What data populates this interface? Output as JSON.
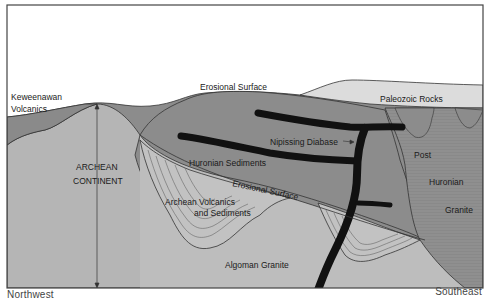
{
  "diagram": {
    "orientation": {
      "left": "Northwest",
      "right": "Southeast"
    },
    "colors": {
      "sky": "#ffffff",
      "keweenawan": "#8a8a8a",
      "archean_continent": "#b5b5b5",
      "huronian_sediments": "#8c8c8c",
      "archean_volcanics": "#c2c2c2",
      "algoman_granite": "#bdbdbd",
      "paleozoic": "#dcdcdc",
      "post_huronian_granite": "#8f8f8f",
      "diabase": "#111111",
      "line": "#333333"
    },
    "labels": {
      "keweenawan_1": "Keweenawan",
      "keweenawan_2": "Volcanics",
      "erosional_surface_top": "Erosional Surface",
      "paleozoic": "Paleozoic Rocks",
      "nipissing": "Nipissing Diabase",
      "archean_1": "ARCHEAN",
      "archean_2": "CONTINENT",
      "huronian_sediments": "Huronian Sediments",
      "erosional_surface_lower": "Erosional Surface",
      "archean_volcanics_1": "Archean Volcanics",
      "archean_volcanics_2": "and Sediments",
      "algoman": "Algoman Granite",
      "post": "Post",
      "huronian": "Huronian",
      "granite": "Granite"
    }
  }
}
